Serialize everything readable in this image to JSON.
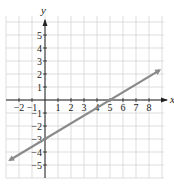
{
  "chart_data": {
    "type": "line",
    "title": "",
    "xlabel": "x",
    "ylabel": "y",
    "xlim": [
      -3,
      9
    ],
    "ylim": [
      -6,
      6
    ],
    "grid": true,
    "x_ticks": [
      -2,
      -1,
      1,
      2,
      3,
      4,
      5,
      6,
      7,
      8
    ],
    "y_ticks": [
      5,
      4,
      3,
      2,
      1,
      -1,
      -2,
      -3,
      -4,
      -5
    ],
    "series": [
      {
        "name": "line",
        "equation": "y = (3/5)x - 3",
        "slope": 0.6,
        "y_intercept": -3,
        "x_intercept": 5,
        "x": [
          -2.7,
          8.8
        ],
        "y": [
          -4.62,
          2.28
        ],
        "arrows": "both"
      }
    ]
  },
  "colors": {
    "grid": "#d4d4d4",
    "axis": "#222222",
    "line": "#8a8a8a",
    "text": "#222222"
  }
}
